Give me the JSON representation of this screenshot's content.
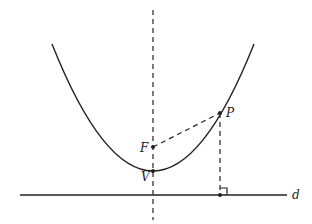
{
  "diagram": {
    "labels": {
      "focus": "F",
      "vertex": "V",
      "point": "P",
      "directrix": "d"
    },
    "points": {
      "F": [
        153,
        147
      ],
      "V": [
        153,
        171
      ],
      "P": [
        220,
        113
      ],
      "foot": [
        220,
        195
      ]
    },
    "colors": {
      "stroke": "#222222",
      "background": "#ffffff"
    }
  }
}
